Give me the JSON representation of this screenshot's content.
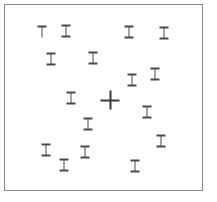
{
  "display": {
    "title": "Visual Search Display",
    "width": 217,
    "height": 202,
    "background_color": "#ffffff"
  },
  "frame": {
    "name": "search-field-border",
    "x": 4,
    "y": 4,
    "width": 199,
    "height": 187,
    "border_color": "#8a8a8a",
    "border_width": 1,
    "fill_color": "#ffffff"
  },
  "stroke_colors": {
    "distractor": "#4a4a4a",
    "target": "#3a3a3a"
  },
  "counts": {
    "distractors": 18,
    "targets": 1,
    "total_items": 19
  },
  "items": [
    {
      "id": 1,
      "glyph": "T",
      "role": "distractor",
      "x": 42,
      "y": 32
    },
    {
      "id": 2,
      "glyph": "I",
      "role": "distractor",
      "x": 66,
      "y": 31
    },
    {
      "id": 3,
      "glyph": "I",
      "role": "distractor",
      "x": 129,
      "y": 32
    },
    {
      "id": 4,
      "glyph": "I",
      "role": "distractor",
      "x": 164,
      "y": 33
    },
    {
      "id": 5,
      "glyph": "I",
      "role": "distractor",
      "x": 51,
      "y": 59
    },
    {
      "id": 6,
      "glyph": "I",
      "role": "distractor",
      "x": 93,
      "y": 58
    },
    {
      "id": 7,
      "glyph": "I",
      "role": "distractor",
      "x": 155,
      "y": 74
    },
    {
      "id": 8,
      "glyph": "I",
      "role": "distractor",
      "x": 132,
      "y": 80
    },
    {
      "id": 9,
      "glyph": "I",
      "role": "distractor",
      "x": 71,
      "y": 98
    },
    {
      "id": 10,
      "glyph": "+",
      "role": "target",
      "x": 110,
      "y": 100
    },
    {
      "id": 11,
      "glyph": "I",
      "role": "distractor",
      "x": 147,
      "y": 112
    },
    {
      "id": 12,
      "glyph": "I",
      "role": "distractor",
      "x": 88,
      "y": 124
    },
    {
      "id": 13,
      "glyph": "I",
      "role": "distractor",
      "x": 161,
      "y": 141
    },
    {
      "id": 14,
      "glyph": "I",
      "role": "distractor",
      "x": 46,
      "y": 150
    },
    {
      "id": 15,
      "glyph": "I",
      "role": "distractor",
      "x": 85,
      "y": 152
    },
    {
      "id": 16,
      "glyph": "I",
      "role": "distractor",
      "x": 64,
      "y": 165
    },
    {
      "id": 17,
      "glyph": "I",
      "role": "distractor",
      "x": 135,
      "y": 166
    }
  ]
}
